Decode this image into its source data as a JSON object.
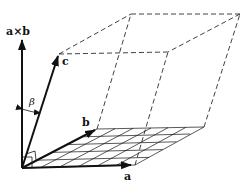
{
  "diagram": {
    "type": "parallelepiped-vector-diagram",
    "labels": {
      "a": "a",
      "b": "b",
      "c": "c",
      "axb": "a×b",
      "beta": "β"
    },
    "vectors": [
      {
        "name": "a",
        "from": [
          22,
          168
        ],
        "to": [
          133,
          165
        ]
      },
      {
        "name": "b",
        "from": [
          22,
          168
        ],
        "to": [
          97,
          129
        ]
      },
      {
        "name": "c",
        "from": [
          22,
          168
        ],
        "to": [
          59,
          54
        ]
      },
      {
        "name": "a×b",
        "from": [
          22,
          168
        ],
        "to": [
          22,
          38
        ]
      }
    ],
    "colors": {
      "stroke": "#111111",
      "background": "#ffffff"
    }
  }
}
